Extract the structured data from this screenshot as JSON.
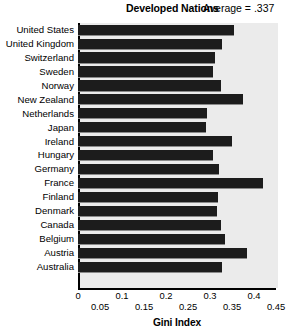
{
  "header": {
    "title": "Developed Nations",
    "annotation": "Average = .337"
  },
  "axis": {
    "xlabel": "Gini Index",
    "ticks_upper": [
      "0",
      "0.1",
      "0.2",
      "0.3",
      "0.4"
    ],
    "ticks_lower": [
      "0.05",
      "0.15",
      "0.25",
      "0.35",
      "0.45"
    ],
    "tick_values_upper": [
      0,
      0.1,
      0.2,
      0.3,
      0.4
    ],
    "tick_values_lower": [
      0.05,
      0.15,
      0.25,
      0.35,
      0.45
    ]
  },
  "colors": {
    "bar": "#1c1c1c",
    "plot_background": "#ebebeb",
    "axis": "#000000",
    "bar_shadow": "#8a8a8a"
  },
  "chart_data": {
    "type": "bar",
    "orientation": "horizontal",
    "title": "Developed Nations",
    "subtitle": "Average = .337",
    "xlabel": "Gini Index",
    "ylabel": "",
    "xlim": [
      0,
      0.45
    ],
    "grid": false,
    "legend": "none",
    "annotations": [
      "Average = .337"
    ],
    "categories": [
      "United States",
      "United Kingdom",
      "Switzerland",
      "Sweden",
      "Norway",
      "New Zealand",
      "Netherlands",
      "Japan",
      "Ireland",
      "Hungary",
      "Germany",
      "France",
      "Finland",
      "Denmark",
      "Canada",
      "Belgium",
      "Austria",
      "Australia"
    ],
    "values": [
      0.355,
      0.327,
      0.311,
      0.307,
      0.325,
      0.375,
      0.293,
      0.291,
      0.35,
      0.307,
      0.32,
      0.42,
      0.318,
      0.316,
      0.325,
      0.334,
      0.385,
      0.328
    ],
    "average": 0.337
  }
}
